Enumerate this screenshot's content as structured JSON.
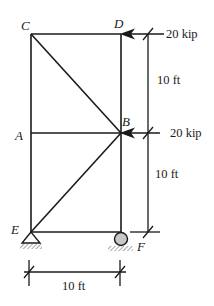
{
  "diagram": {
    "type": "truss",
    "nodes": {
      "C": {
        "label": "C"
      },
      "D": {
        "label": "D"
      },
      "A": {
        "label": "A"
      },
      "B": {
        "label": "B"
      },
      "E": {
        "label": "E"
      },
      "F": {
        "label": "F"
      }
    },
    "members": [
      "C-D",
      "C-A",
      "A-E",
      "D-B",
      "B-F",
      "A-B",
      "E-F",
      "C-B",
      "E-B"
    ],
    "loads": [
      {
        "node": "D",
        "label": "20 kip",
        "direction": "left"
      },
      {
        "node": "B",
        "label": "20 kip",
        "direction": "left"
      }
    ],
    "dimensions": {
      "upper_height": "10 ft",
      "lower_height": "10 ft",
      "width": "10 ft"
    },
    "supports": {
      "E": "pin",
      "F": "roller"
    },
    "colors": {
      "line": "#1a1a1a",
      "roller_fill": "#c8c8c8",
      "background": "#ffffff"
    }
  }
}
